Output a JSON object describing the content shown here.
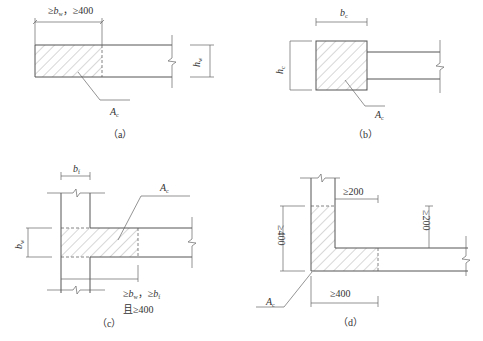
{
  "figures": [
    {
      "id": "a",
      "caption": "（a）",
      "dim_top": "≥b_w，≥400",
      "dim_top_parts": {
        "ge1": "≥",
        "b": "b",
        "b_sub": "w",
        "sep": "，",
        "ge2": "≥400"
      },
      "dim_right": {
        "sym": "h",
        "sub": "w"
      },
      "area_label": {
        "sym": "A",
        "sub": "c"
      }
    },
    {
      "id": "b",
      "caption": "（b）",
      "dim_top": {
        "sym": "b",
        "sub": "c"
      },
      "dim_left": {
        "sym": "h",
        "sub": "c"
      },
      "area_label": {
        "sym": "A",
        "sub": "c"
      }
    },
    {
      "id": "c",
      "caption": "（c）",
      "dim_top": {
        "sym": "b",
        "sub": "f"
      },
      "dim_left": {
        "sym": "b",
        "sub": "w"
      },
      "area_label": {
        "sym": "A",
        "sub": "c"
      },
      "dim_bottom_line1": {
        "ge1": "≥",
        "b1": "b",
        "b1_sub": "w",
        "sep": "，",
        "ge2": "≥",
        "b2": "b",
        "b2_sub": "f"
      },
      "dim_bottom_line2": "且≥400"
    },
    {
      "id": "d",
      "caption": "（d）",
      "dim_top": "≥200",
      "dim_right": "≥200",
      "dim_left": "≥400",
      "dim_bottom": "≥400",
      "area_label": {
        "sym": "A",
        "sub": "c"
      }
    }
  ]
}
